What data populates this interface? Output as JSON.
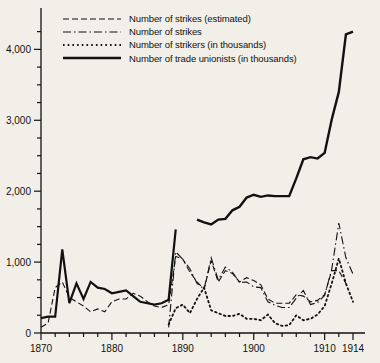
{
  "chart_data": {
    "type": "line",
    "title": "",
    "xlabel": "",
    "ylabel": "",
    "xlim": [
      1870,
      1914
    ],
    "ylim": [
      0,
      4400
    ],
    "grid": false,
    "legend_position": "top-left",
    "x_ticks_major": [
      "1870",
      "1880",
      "1890",
      "1900",
      "1910",
      "1914"
    ],
    "x_ticks_major_values": [
      1870,
      1880,
      1890,
      1900,
      1910,
      1914
    ],
    "x_tick_minor_step": 2,
    "y_ticks_major": [
      "0",
      "1,000",
      "2,000",
      "3,000",
      "4,000"
    ],
    "y_ticks_major_values": [
      0,
      1000,
      2000,
      3000,
      4000
    ],
    "y_tick_minor_step": 250,
    "series": [
      {
        "name": "Number of strikes (estimated)",
        "key": "strikes-estimated",
        "style": "dashed",
        "dasharray": "6,3",
        "width": 1.1,
        "x": [
          1870,
          1871,
          1872,
          1873,
          1874,
          1875,
          1876,
          1877,
          1878,
          1879,
          1880,
          1881,
          1882,
          1883,
          1884,
          1885,
          1886,
          1887,
          1888,
          1889,
          1890,
          1891,
          1892,
          1893,
          1894,
          1895,
          1896,
          1897,
          1898,
          1899,
          1900,
          1901,
          1902,
          1903,
          1904,
          1905,
          1906,
          1907,
          1908,
          1909,
          1910,
          1911,
          1912,
          1913
        ],
        "y": [
          80,
          140,
          640,
          720,
          500,
          440,
          380,
          300,
          340,
          300,
          440,
          480,
          480,
          560,
          520,
          440,
          380,
          360,
          400,
          1080,
          1040,
          860,
          720,
          620,
          1020,
          720,
          880,
          840,
          720,
          780,
          740,
          680,
          480,
          420,
          420,
          420,
          540,
          520,
          440,
          460,
          540,
          880,
          880,
          700
        ]
      },
      {
        "name": "Number of strikes",
        "key": "strikes",
        "style": "dash-dot",
        "dasharray": "8,3,1.5,3",
        "width": 1.1,
        "x": [
          1888,
          1889,
          1890,
          1891,
          1892,
          1893,
          1894,
          1895,
          1896,
          1897,
          1898,
          1899,
          1900,
          1901,
          1902,
          1903,
          1904,
          1905,
          1906,
          1907,
          1908,
          1909,
          1910,
          1911,
          1912,
          1913,
          1914
        ],
        "y": [
          80,
          1145,
          1040,
          906,
          700,
          620,
          1060,
          750,
          930,
          860,
          710,
          720,
          650,
          640,
          440,
          390,
          360,
          360,
          490,
          600,
          400,
          430,
          530,
          900,
          1550,
          1060,
          830
        ]
      },
      {
        "name": "Number of strikers (in thousands)",
        "key": "strikers-thousands",
        "style": "dotted",
        "dasharray": "1.6,3.1",
        "width": 1.8,
        "x": [
          1888,
          1889,
          1890,
          1891,
          1892,
          1893,
          1894,
          1895,
          1896,
          1897,
          1898,
          1899,
          1900,
          1901,
          1902,
          1903,
          1904,
          1905,
          1906,
          1907,
          1908,
          1909,
          1910,
          1911,
          1912,
          1913,
          1914
        ],
        "y": [
          120,
          350,
          400,
          280,
          480,
          640,
          320,
          280,
          240,
          240,
          270,
          200,
          200,
          180,
          260,
          140,
          100,
          110,
          250,
          180,
          200,
          260,
          380,
          700,
          1050,
          700,
          440
        ]
      },
      {
        "name": "Number of trade unionists (in thousands)",
        "key": "trade-unionists-thousands",
        "style": "solid",
        "dasharray": "",
        "width": 2.4,
        "x": [
          1892,
          1893,
          1894,
          1895,
          1896,
          1897,
          1898,
          1899,
          1900,
          1901,
          1902,
          1903,
          1904,
          1905,
          1906,
          1907,
          1908,
          1909,
          1910,
          1911,
          1912,
          1913,
          1914
        ],
        "y": [
          1600,
          1560,
          1530,
          1600,
          1610,
          1730,
          1780,
          1910,
          1950,
          1920,
          1940,
          1930,
          1930,
          1930,
          2180,
          2450,
          2480,
          2460,
          2540,
          3010,
          3400,
          4210,
          4250
        ]
      },
      {
        "name": "Number of strikes (estimated) early-solid",
        "key": "strikes-early-solid",
        "style": "solid",
        "dasharray": "",
        "width": 2.2,
        "x": [
          1870,
          1871,
          1872,
          1873,
          1874,
          1875,
          1876,
          1877,
          1878,
          1879,
          1880,
          1881,
          1882,
          1883,
          1884,
          1885,
          1886,
          1887,
          1888,
          1889
        ],
        "y": [
          210,
          230,
          230,
          1180,
          420,
          700,
          480,
          720,
          640,
          620,
          560,
          580,
          600,
          520,
          440,
          420,
          400,
          420,
          470,
          1460
        ]
      }
    ],
    "annotations": []
  },
  "legend": {
    "items": [
      {
        "label": "Number of strikes (estimated)",
        "key": "strikes-estimated"
      },
      {
        "label": "Number of strikes",
        "key": "strikes"
      },
      {
        "label": "Number of strikers (in thousands)",
        "key": "strikers-thousands"
      },
      {
        "label": "Number of trade unionists (in thousands)",
        "key": "trade-unionists-thousands"
      }
    ]
  },
  "colors": {
    "background": "#f1efe7",
    "ink": "#111111",
    "axis": "#111111"
  }
}
